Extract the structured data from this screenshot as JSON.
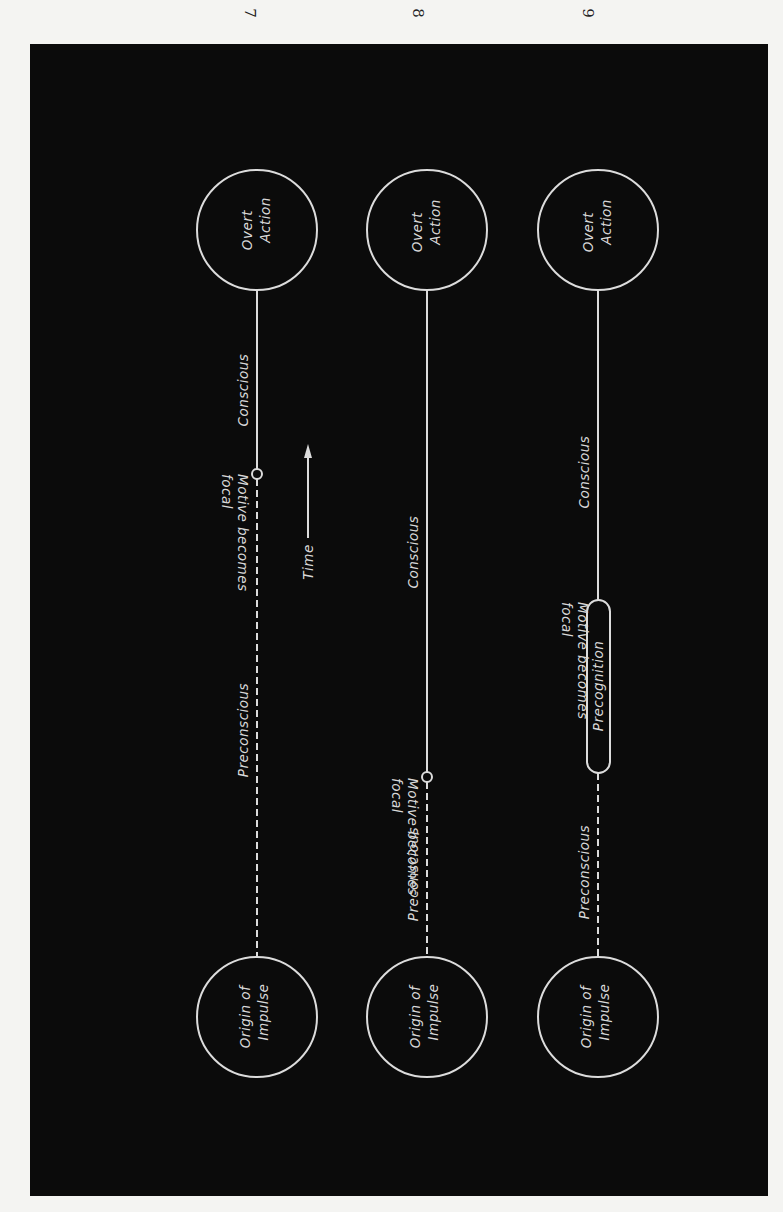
{
  "page_numbers": [
    "7",
    "8",
    "9"
  ],
  "figure": {
    "time_label": "Time",
    "rows": [
      {
        "id": "7",
        "start_node": [
          "Origin of",
          "Impulse"
        ],
        "end_node": [
          "Overt",
          "Action"
        ],
        "preconscious_label": "Preconscious",
        "conscious_label": "Conscious",
        "focal_marker": "circle",
        "focal_label": [
          "Motive becomes",
          "focal"
        ]
      },
      {
        "id": "8",
        "start_node": [
          "Origin of",
          "Impulse"
        ],
        "end_node": [
          "Overt",
          "Action"
        ],
        "preconscious_label": "Preconscious",
        "conscious_label": "Conscious",
        "focal_marker": "circle",
        "focal_label": [
          "Motive becomes",
          "focal"
        ]
      },
      {
        "id": "9",
        "start_node": [
          "Origin of",
          "Impulse"
        ],
        "end_node": [
          "Overt",
          "Action"
        ],
        "preconscious_label": "Preconscious",
        "conscious_label": "Conscious",
        "focal_marker": "capsule",
        "capsule_label": "Precognition",
        "focal_label": [
          "Motive becomes",
          "focal"
        ]
      }
    ],
    "colors": {
      "background": "#0b0b0b",
      "lines": "#dcdcdc",
      "page": "#f4f4f2"
    }
  }
}
